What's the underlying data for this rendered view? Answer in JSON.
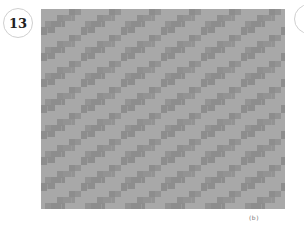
{
  "figure": {
    "number_badge": "13",
    "caption_marker": "(b)",
    "texture": {
      "description": "Gray textured pattern of rectangular brick-like blocks arranged in diagonal bands rising to the upper right",
      "background_color": "#a8a8a8",
      "block_color": "#8d8d8d",
      "block_color_alt": "#939393",
      "period_x": 40,
      "period_y": 26
    }
  }
}
